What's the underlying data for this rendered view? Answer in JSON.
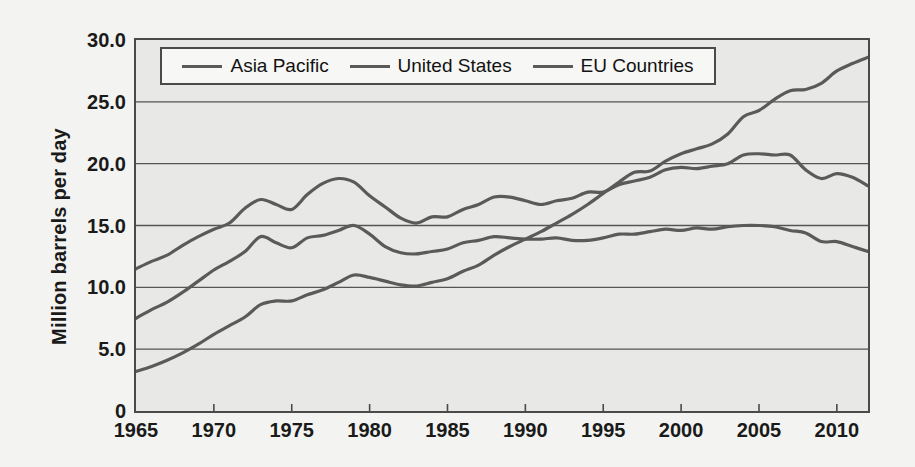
{
  "chart_data": {
    "type": "line",
    "title": "",
    "xlabel": "",
    "ylabel": "Million  barrels per day",
    "xlim": [
      1965,
      2012
    ],
    "ylim": [
      0,
      30
    ],
    "grid": true,
    "legend_position": "top-inside",
    "y_ticks": [
      "0",
      "5.0",
      "10.0",
      "15.0",
      "20.0",
      "25.0",
      "30.0"
    ],
    "y_tick_values": [
      0,
      5,
      10,
      15,
      20,
      25,
      30
    ],
    "x_ticks": [
      "1965",
      "1970",
      "1975",
      "1980",
      "1985",
      "1990",
      "1995",
      "2000",
      "2005",
      "2010"
    ],
    "x_tick_values": [
      1965,
      1970,
      1975,
      1980,
      1985,
      1990,
      1995,
      2000,
      2005,
      2010
    ],
    "x": [
      1965,
      1966,
      1967,
      1968,
      1969,
      1970,
      1971,
      1972,
      1973,
      1974,
      1975,
      1976,
      1977,
      1978,
      1979,
      1980,
      1981,
      1982,
      1983,
      1984,
      1985,
      1986,
      1987,
      1988,
      1989,
      1990,
      1991,
      1992,
      1993,
      1994,
      1995,
      1996,
      1997,
      1998,
      1999,
      2000,
      2001,
      2002,
      2003,
      2004,
      2005,
      2006,
      2007,
      2008,
      2009,
      2010,
      2011,
      2012
    ],
    "series": [
      {
        "name": "Asia Pacific",
        "color": "#5a5a5a",
        "values": [
          3.2,
          3.6,
          4.1,
          4.7,
          5.4,
          6.2,
          6.9,
          7.6,
          8.6,
          8.9,
          8.9,
          9.4,
          9.8,
          10.4,
          11.0,
          10.8,
          10.5,
          10.2,
          10.1,
          10.4,
          10.7,
          11.3,
          11.8,
          12.6,
          13.3,
          13.9,
          14.5,
          15.2,
          15.9,
          16.7,
          17.6,
          18.5,
          19.3,
          19.4,
          20.2,
          20.8,
          21.2,
          21.6,
          22.4,
          23.8,
          24.3,
          25.2,
          25.9,
          26.0,
          26.5,
          27.5,
          28.1,
          28.6
        ]
      },
      {
        "name": "United States",
        "color": "#5a5a5a",
        "values": [
          11.5,
          12.1,
          12.6,
          13.4,
          14.1,
          14.7,
          15.2,
          16.4,
          17.1,
          16.7,
          16.3,
          17.5,
          18.4,
          18.8,
          18.5,
          17.4,
          16.5,
          15.6,
          15.2,
          15.7,
          15.7,
          16.3,
          16.7,
          17.3,
          17.3,
          17.0,
          16.7,
          17.0,
          17.2,
          17.7,
          17.7,
          18.3,
          18.6,
          18.9,
          19.5,
          19.7,
          19.6,
          19.8,
          20.0,
          20.7,
          20.8,
          20.7,
          20.7,
          19.5,
          18.8,
          19.2,
          18.9,
          18.2
        ]
      },
      {
        "name": "EU Countries",
        "color": "#5a5a5a",
        "values": [
          7.5,
          8.2,
          8.8,
          9.6,
          10.5,
          11.4,
          12.1,
          12.9,
          14.1,
          13.6,
          13.2,
          14.0,
          14.2,
          14.6,
          15.0,
          14.3,
          13.3,
          12.8,
          12.7,
          12.9,
          13.1,
          13.6,
          13.8,
          14.1,
          14.0,
          13.9,
          13.9,
          14.0,
          13.8,
          13.8,
          14.0,
          14.3,
          14.3,
          14.5,
          14.7,
          14.6,
          14.8,
          14.7,
          14.9,
          15.0,
          15.0,
          14.9,
          14.6,
          14.4,
          13.7,
          13.7,
          13.3,
          12.9
        ]
      }
    ]
  },
  "legend": {
    "items": [
      {
        "label": "Asia Pacific"
      },
      {
        "label": "United States"
      },
      {
        "label": "EU Countries"
      }
    ]
  }
}
